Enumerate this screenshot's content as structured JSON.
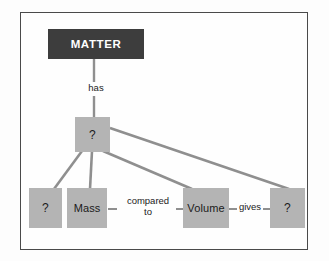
{
  "diagram": {
    "kind": "concept-map",
    "colors": {
      "root_box_fill": "#3d3d3d",
      "root_box_text": "#ffffff",
      "node_fill": "#b4b4b4",
      "node_text": "#1b1b1b",
      "connector": "#8f8f8f",
      "frame_border": "#4a4a4a",
      "page_background": "#fdfdfd"
    },
    "nodes": [
      {
        "id": "matter",
        "label": "MATTER",
        "style": "dark"
      },
      {
        "id": "center_q",
        "label": "?",
        "style": "blank"
      },
      {
        "id": "left_q",
        "label": "?",
        "style": "blank"
      },
      {
        "id": "mass",
        "label": "Mass",
        "style": "filled"
      },
      {
        "id": "volume",
        "label": "Volume",
        "style": "filled"
      },
      {
        "id": "right_q",
        "label": "?",
        "style": "blank"
      }
    ],
    "edge_labels": {
      "has": "has",
      "compared_line1": "compared",
      "compared_line2": "to",
      "gives": "gives"
    },
    "edges": [
      {
        "from": "matter",
        "to": "center_q",
        "label": "has"
      },
      {
        "from": "center_q",
        "to": "left_q",
        "label": ""
      },
      {
        "from": "center_q",
        "to": "mass",
        "label": ""
      },
      {
        "from": "center_q",
        "to": "volume",
        "label": ""
      },
      {
        "from": "center_q",
        "to": "right_q",
        "label": ""
      },
      {
        "from": "mass",
        "to": "volume",
        "label": "compared to"
      },
      {
        "from": "volume",
        "to": "right_q",
        "label": "gives"
      }
    ]
  }
}
